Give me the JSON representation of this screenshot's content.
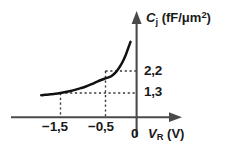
{
  "chart_data": {
    "type": "line",
    "title": "",
    "subtitle": "",
    "xlabel": "V_R (V)",
    "ylabel": "C_j (fF/um^2)",
    "xlabel_parts": {
      "symbol": "V",
      "subscript": "R",
      "unit": "(V)"
    },
    "ylabel_parts": {
      "symbol": "C",
      "subscript": "j",
      "unit_prefix": "(fF/",
      "unit_mu": "μ",
      "unit_m": "m",
      "unit_exponent": "2",
      "unit_suffix": ")"
    },
    "origin_label": "0",
    "grid": false,
    "legend": null,
    "decimal_separator": ",",
    "xticks": [
      {
        "label": "−1,5",
        "value": -1.5
      },
      {
        "label": "−0,5",
        "value": -0.5
      }
    ],
    "yticks": [
      {
        "label": "2,2",
        "value": 2.2
      },
      {
        "label": "1,3",
        "value": 1.3
      }
    ],
    "xlim": [
      -1.95,
      0.12
    ],
    "ylim": [
      0.0,
      4.3
    ],
    "annotations": [
      {
        "name": "dashed-guide-minus-1-5",
        "x": -1.5,
        "y": 1.3
      },
      {
        "name": "dashed-guide-minus-0-5",
        "x": -0.5,
        "y": 2.2
      }
    ],
    "series": [
      {
        "name": "junction-capacitance",
        "x": [
          -1.88,
          -1.8,
          -1.7,
          -1.6,
          -1.5,
          -1.4,
          -1.3,
          -1.2,
          -1.1,
          -1.0,
          -0.9,
          -0.8,
          -0.7,
          -0.6,
          -0.5,
          -0.4,
          -0.3,
          -0.22,
          -0.16,
          -0.12
        ],
        "y": [
          1.18,
          1.2,
          1.23,
          1.26,
          1.3,
          1.35,
          1.41,
          1.48,
          1.56,
          1.65,
          1.76,
          1.88,
          2.0,
          2.1,
          2.2,
          2.45,
          2.85,
          3.3,
          3.75,
          4.05
        ]
      }
    ],
    "axis_style": {
      "line_color": "#3d3d3d",
      "curve_color": "#111111",
      "dash_color": "#3a3a3a",
      "arrow": true
    }
  }
}
